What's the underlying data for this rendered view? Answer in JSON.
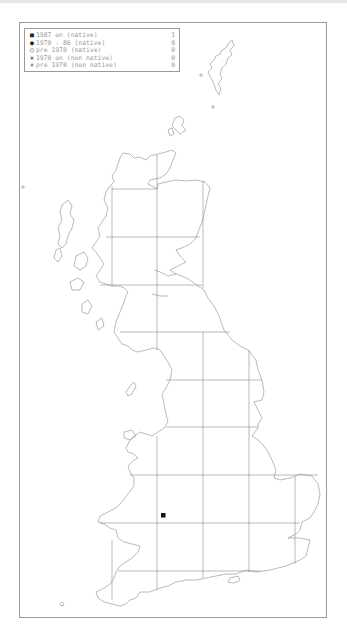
{
  "legend": {
    "rows": [
      {
        "symbol": "filled-square",
        "glyph": "■",
        "label": "1987 on (native)",
        "count": "1"
      },
      {
        "symbol": "filled-circle",
        "glyph": "●",
        "label": "1970 - 86 (native)",
        "count": "0"
      },
      {
        "symbol": "open-circle",
        "glyph": "○",
        "label": "pre 1970 (native)",
        "count": "0"
      },
      {
        "symbol": "cross",
        "glyph": "✕",
        "label": "1970 on (non native)",
        "count": "0"
      },
      {
        "symbol": "plus",
        "glyph": "+",
        "label": "pre 1970 (non native)",
        "count": "0"
      }
    ]
  },
  "map": {
    "region": "Great Britain",
    "grid_color": "#8c8c8c",
    "coast_color": "#8a8a8a",
    "records": [
      {
        "type": "1987 on (native)",
        "x": 163,
        "y": 515
      }
    ]
  }
}
